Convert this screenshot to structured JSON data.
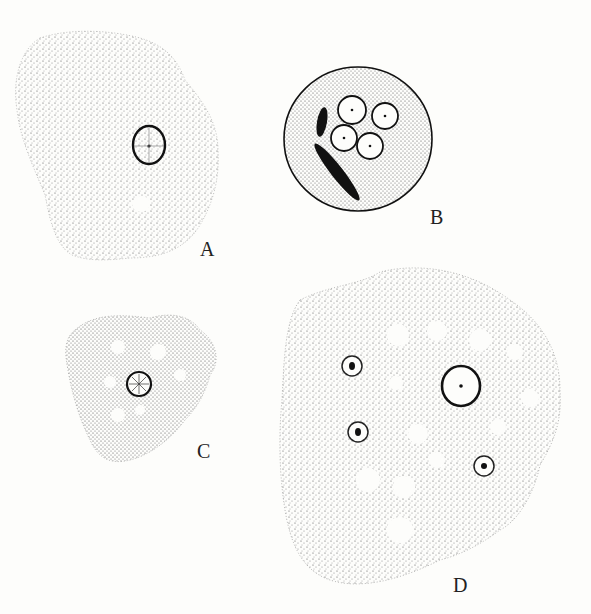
{
  "figure": {
    "panels": [
      {
        "id": "A",
        "label": "A",
        "description": "Amoeboid cell with single nucleus and one clear vacuole"
      },
      {
        "id": "B",
        "label": "B",
        "description": "Rounded cyst with four nuclei and two chromatoid bars"
      },
      {
        "id": "C",
        "label": "C",
        "description": "Small amoeboid cell with one nucleus and several vacuoles"
      },
      {
        "id": "D",
        "label": "D",
        "description": "Large amoeboid cell with one nucleus and many food vacuoles, some containing ingested bodies"
      }
    ]
  }
}
